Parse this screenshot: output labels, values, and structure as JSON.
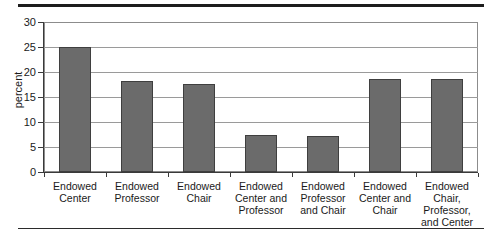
{
  "chart_data": {
    "type": "bar",
    "title": "",
    "xlabel": "",
    "ylabel": "percent",
    "ylim": [
      0,
      30
    ],
    "yticks": [
      0,
      5,
      10,
      15,
      20,
      25,
      30
    ],
    "grid": true,
    "legend": false,
    "categories": [
      "Endowed Center",
      "Endowed Professor",
      "Endowed Chair",
      "Endowed Center and Professor",
      "Endowed Professor and Chair",
      "Endowed Center and Chair",
      "Endowed Chair, Professor, and Center"
    ],
    "category_lines": [
      [
        "Endowed",
        "Center"
      ],
      [
        "Endowed",
        "Professor"
      ],
      [
        "Endowed",
        "Chair"
      ],
      [
        "Endowed",
        "Center and",
        "Professor"
      ],
      [
        "Endowed",
        "Professor",
        "and Chair"
      ],
      [
        "Endowed",
        "Center and",
        "Chair"
      ],
      [
        "Endowed",
        "Chair,",
        "Professor,",
        "and Center"
      ]
    ],
    "values": [
      25.0,
      18.3,
      17.6,
      7.4,
      7.2,
      18.6,
      18.7
    ],
    "bar_color": "#6b6b6b",
    "bar_edge_color": "#3f3f3f",
    "gridline_color": "#9a9a9a",
    "axis_color": "#3a3a3a"
  }
}
